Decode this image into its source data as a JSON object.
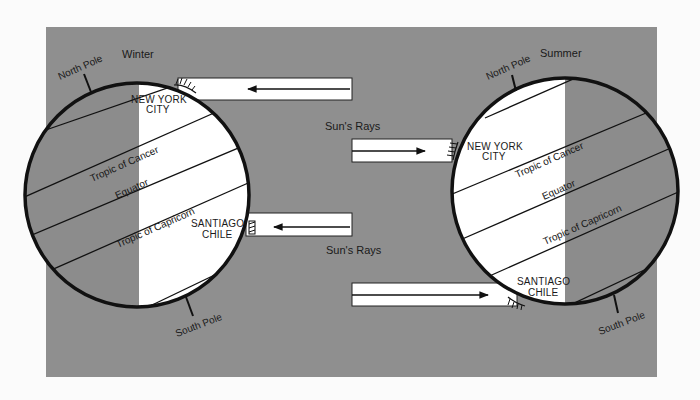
{
  "diagram": {
    "colors": {
      "panel": "#8f8f8f",
      "day": "#ffffff",
      "night": "#8c8c8c",
      "ink": "#111111",
      "page": "#fbfbfb"
    },
    "winter": {
      "season_label": "Winter",
      "north_pole": "North Pole",
      "south_pole": "South Pole",
      "city_north_line1": "NEW YORK",
      "city_north_line2": "CITY",
      "city_south_line1": "SANTIAGO",
      "city_south_line2": "CHILE",
      "tropic_cancer": "Tropic of Cancer",
      "equator": "Equator",
      "tropic_capricorn": "Tropic of Capricorn"
    },
    "summer": {
      "season_label": "Summer",
      "north_pole": "North Pole",
      "south_pole": "South Pole",
      "city_north_line1": "NEW YORK",
      "city_north_line2": "CITY",
      "city_south_line1": "SANTIAGO",
      "city_south_line2": "CHILE",
      "tropic_cancer": "Tropic of Cancer",
      "equator": "Equator",
      "tropic_capricorn": "Tropic of Capricorn"
    },
    "rays": {
      "label_upper": "Sun's Rays",
      "label_lower": "Sun's Rays"
    }
  }
}
